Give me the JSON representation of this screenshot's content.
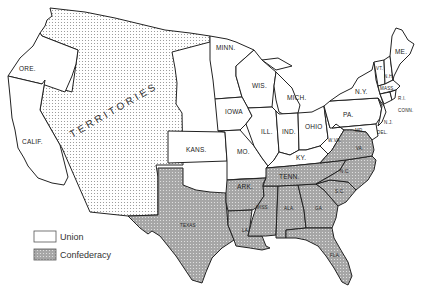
{
  "map": {
    "title": "",
    "colors": {
      "union_fill": "#ffffff",
      "confederacy_fill": "#a9a9a9",
      "territory_fill": "#ffffff",
      "territory_dots": "#9a9a9a",
      "border": "#222222"
    },
    "regions": {
      "territories": {
        "label": "TERRITORIES",
        "side": "territory"
      },
      "ore": {
        "label": "ORE.",
        "side": "union"
      },
      "calif": {
        "label": "CALIF.",
        "side": "union"
      },
      "minn": {
        "label": "MINN.",
        "side": "union"
      },
      "wis": {
        "label": "WIS.",
        "side": "union"
      },
      "iowa": {
        "label": "IOWA",
        "side": "union"
      },
      "mich": {
        "label": "MICH.",
        "side": "union"
      },
      "ill": {
        "label": "ILL.",
        "side": "union"
      },
      "ind": {
        "label": "IND.",
        "side": "union"
      },
      "ohio": {
        "label": "OHIO",
        "side": "union"
      },
      "kans": {
        "label": "KANS.",
        "side": "union"
      },
      "mo": {
        "label": "MO.",
        "side": "union"
      },
      "ky": {
        "label": "KY.",
        "side": "union"
      },
      "wva": {
        "label": "W.VA.",
        "side": "union"
      },
      "pa": {
        "label": "PA.",
        "side": "union"
      },
      "ny": {
        "label": "N.Y.",
        "side": "union"
      },
      "me": {
        "label": "ME.",
        "side": "union"
      },
      "vt": {
        "label": "VT.",
        "side": "union"
      },
      "nh": {
        "label": "N.H.",
        "side": "union"
      },
      "mass": {
        "label": "MASS.",
        "side": "union"
      },
      "ri": {
        "label": "R.I.",
        "side": "union"
      },
      "conn": {
        "label": "CONN.",
        "side": "union"
      },
      "nj": {
        "label": "N.J.",
        "side": "union"
      },
      "del": {
        "label": "DEL.",
        "side": "union"
      },
      "md": {
        "label": "MD.",
        "side": "union"
      },
      "texas": {
        "label": "TEXAS",
        "side": "confederacy"
      },
      "ark": {
        "label": "ARK.",
        "side": "confederacy"
      },
      "la": {
        "label": "LA.",
        "side": "confederacy"
      },
      "miss": {
        "label": "MISS.",
        "side": "confederacy"
      },
      "ala": {
        "label": "ALA.",
        "side": "confederacy"
      },
      "ga": {
        "label": "GA.",
        "side": "confederacy"
      },
      "fla": {
        "label": "FLA.",
        "side": "confederacy"
      },
      "sc": {
        "label": "S.C.",
        "side": "confederacy"
      },
      "nc": {
        "label": "N.C.",
        "side": "confederacy"
      },
      "tenn": {
        "label": "TENN.",
        "side": "confederacy"
      },
      "va": {
        "label": "VA.",
        "side": "confederacy"
      }
    },
    "legend": {
      "items": [
        {
          "label": "Union",
          "swatch": "union"
        },
        {
          "label": "Confederacy",
          "swatch": "confederacy"
        }
      ]
    }
  }
}
